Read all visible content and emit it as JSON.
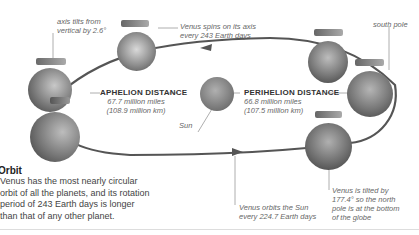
{
  "diagram": {
    "labels": {
      "axis_tilt": [
        "axis tilts from",
        "vertical by 2.6°"
      ],
      "spin": [
        "Venus spins on its axis",
        "every 243 Earth days"
      ],
      "south_pole": "south pole",
      "aphelion_title": "APHELION DISTANCE",
      "aphelion_miles": "67.7 million miles",
      "aphelion_km": "(108.9 million km)",
      "perihelion_title": "PERIHELION DISTANCE",
      "perihelion_miles": "66.8 million miles",
      "perihelion_km": "(107.5 million km)",
      "sun": "Sun",
      "orbit_period": [
        "Venus orbits the Sun",
        "every 224.7 Earth days"
      ],
      "tilt_177": [
        "Venus is tilted by",
        "177.4° so the north",
        "pole is at the bottom",
        "of the globe"
      ]
    },
    "colors": {
      "orbit_line": "#555555",
      "planet_dark": "#4a4a4a",
      "planet_light": "#b5b5b5",
      "sun": "#8a8a8a",
      "leader_line": "#999999"
    }
  },
  "sidebar": {
    "title": "Orbit",
    "body": "Venus has the most nearly circular orbit of all the planets, and its rotation period of 243 Earth days is longer than that of any other planet."
  }
}
